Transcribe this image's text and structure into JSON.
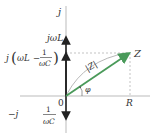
{
  "diagram": {
    "axes": {
      "imag_axis_label": "j",
      "origin_label": "0"
    },
    "labels": {
      "jwL": "jωL",
      "j_prefix": "j",
      "wL": "ωL",
      "minus": "−",
      "one": "1",
      "wC": "ωC",
      "neg_j": "−j",
      "Z": "Z",
      "absZ": "|Z|",
      "phi": "φ",
      "R": "R"
    },
    "colors": {
      "impedance_vector": "#4a9a5a",
      "axis": "#999999",
      "reactance_arrows": "#222222",
      "guide_dashed": "#aaaaaa"
    }
  }
}
